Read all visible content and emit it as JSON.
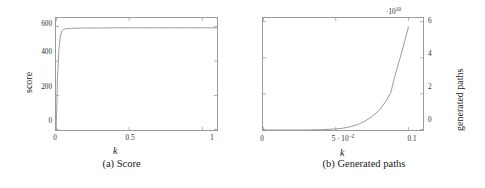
{
  "figure": {
    "subfigures": [
      {
        "id": "a",
        "caption": "(a) Score",
        "xlabel": "k",
        "ylabel": "score"
      },
      {
        "id": "b",
        "caption": "(b) Generated paths",
        "xlabel": "k",
        "ylabel": "generated paths",
        "y_exponent_label": "·10",
        "y_exponent_sup": "10"
      }
    ]
  },
  "chart_data": [
    {
      "type": "line",
      "title": "(a) Score",
      "xlabel": "k",
      "ylabel": "score",
      "xlim": [
        0,
        1.1
      ],
      "ylim": [
        0,
        650
      ],
      "xticks": [
        0,
        0.5,
        1
      ],
      "xticklabels": [
        "0",
        "0.5",
        "1"
      ],
      "yticks": [
        0,
        200,
        400,
        600
      ],
      "yticklabels": [
        "0",
        "200",
        "400",
        "600"
      ],
      "grid": false,
      "legend": null,
      "x": [
        0,
        0.005,
        0.01,
        0.02,
        0.03,
        0.04,
        0.05,
        0.07,
        0.1,
        0.15,
        0.2,
        0.3,
        0.4,
        0.5,
        0.6,
        0.7,
        0.8,
        0.9,
        1.0,
        1.1
      ],
      "y": [
        0,
        120,
        300,
        470,
        545,
        575,
        583,
        588,
        590,
        591,
        592,
        592,
        593,
        593,
        593,
        593,
        593,
        593,
        593,
        593
      ]
    },
    {
      "type": "line",
      "title": "(b) Generated paths",
      "xlabel": "k",
      "ylabel": "generated paths",
      "xlim": [
        0,
        0.11
      ],
      "ylim": [
        0,
        62000000000.0
      ],
      "xticks": [
        0,
        0.05,
        0.1
      ],
      "xticklabels": [
        "0",
        "5 · 10⁻²",
        "0.1"
      ],
      "yticks": [
        0,
        20000000000.0,
        40000000000.0,
        60000000000.0
      ],
      "yticklabels": [
        "0",
        "2",
        "4",
        "6"
      ],
      "y_axis_multiplier": "·10^10",
      "y_axis_side": "right",
      "grid": false,
      "legend": null,
      "x": [
        0,
        0.01,
        0.02,
        0.03,
        0.04,
        0.05,
        0.055,
        0.06,
        0.065,
        0.07,
        0.075,
        0.08,
        0.085,
        0.088,
        0.09,
        0.095,
        0.1
      ],
      "y": [
        0,
        0,
        0,
        0,
        200000000.0,
        600000000.0,
        1000000000.0,
        1800000000.0,
        3000000000.0,
        4800000000.0,
        7500000000.0,
        11000000000.0,
        16500000000.0,
        21000000000.0,
        28000000000.0,
        42000000000.0,
        57000000000.0
      ]
    }
  ],
  "style": {
    "line_color": "#9a9a9a",
    "frame_color": "#9a9a9a",
    "text_color": "#1a1a1a",
    "background": "#ffffff"
  }
}
